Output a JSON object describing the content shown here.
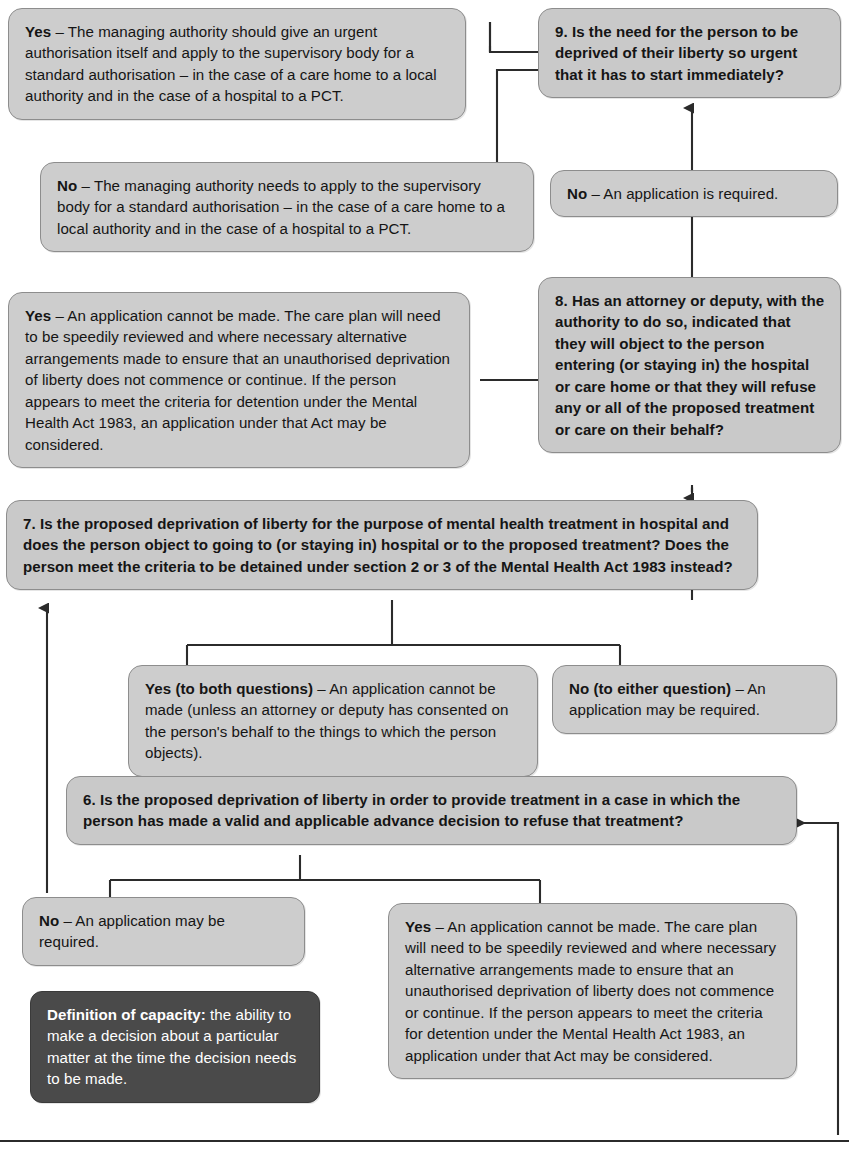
{
  "diagram": {
    "colors": {
      "box_fill": "#cdcdcd",
      "box_border": "#8d8d8d",
      "dark_box_fill": "#4a4a4a",
      "text": "#151515",
      "dark_box_text": "#ffffff",
      "connector": "#2b2b2b"
    }
  },
  "nodes": {
    "q9_yes": {
      "lead": "Yes",
      "text": " – The managing authority should give an urgent authorisation itself and apply to the supervisory body for a standard authorisation – in the case of a care home to a local authority and in the case of a hospital to a PCT."
    },
    "q9": {
      "lead": "",
      "text": "9. Is the need for the person to be deprived of their liberty so urgent that it has to start immediately?"
    },
    "q9_no": {
      "lead": "No",
      "text": " – The managing authority needs to apply to the supervisory body for a standard authorisation – in the case of a care home to a local authority and in the case of a hospital to a PCT."
    },
    "q8_no": {
      "lead": "No",
      "text": " – An application is required."
    },
    "q8_yes": {
      "lead": "Yes",
      "text": " – An application cannot be made. The care plan will need to be speedily reviewed and where necessary alternative arrangements made to ensure that an unauthorised deprivation of liberty does not commence or continue. If the person appears to meet the criteria for detention under the Mental Health Act 1983, an application under that Act may be considered."
    },
    "q8": {
      "lead": "",
      "text": "8. Has an attorney or deputy, with the authority to do so, indicated that they will object to the person entering (or staying in) the hospital or care home or that they will refuse any or all of the proposed treatment or care on their behalf?"
    },
    "q7": {
      "lead": "",
      "text": "7. Is the proposed deprivation of liberty for the purpose of mental health treatment in hospital and does the person object to going to (or staying in) hospital or to the proposed treatment? Does the person meet the criteria to be detained under section 2 or 3 of the Mental Health Act 1983 instead?"
    },
    "q7_yes": {
      "lead": "Yes (to both questions)",
      "text": " – An application cannot be made (unless an attorney or deputy has consented on the person's behalf to the things to which the person objects)."
    },
    "q7_no": {
      "lead": "No (to either question)",
      "text": " – An application may be required."
    },
    "q6": {
      "lead": "",
      "text": "6. Is the proposed deprivation of liberty in order to provide treatment in a case in which the person has made a valid and applicable advance decision to refuse that treatment?"
    },
    "q6_no": {
      "lead": "No",
      "text": " – An application may be required."
    },
    "q6_yes": {
      "lead": "Yes",
      "text": " – An application cannot be made. The care plan will need to be speedily reviewed and where necessary alternative arrangements made to ensure that an unauthorised deprivation of liberty does not commence or continue. If the person appears to meet the criteria for detention under the Mental Health Act 1983, an application under that Act may be considered."
    },
    "capacity_note": {
      "lead": "Definition of capacity:",
      "text": " the ability to make a decision about a particular matter at the time the decision needs to be made."
    }
  }
}
